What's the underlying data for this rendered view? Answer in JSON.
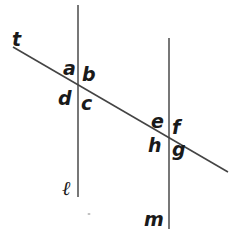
{
  "figure": {
    "colors": {
      "line": "#555555",
      "text": "#1a1a1a",
      "background": "#ffffff"
    },
    "lines": {
      "l": {
        "label": "ℓ",
        "x": 78,
        "y1": 5,
        "y2": 197
      },
      "m": {
        "label": "m",
        "x": 169,
        "y1": 38,
        "y2": 229
      },
      "t": {
        "label": "t",
        "x1": 13,
        "y1": 47,
        "x2": 228,
        "y2": 172
      }
    },
    "angle_labels": {
      "a": "a",
      "b": "b",
      "c": "c",
      "d": "d",
      "e": "e",
      "f": "f",
      "g": "g",
      "h": "h"
    }
  }
}
